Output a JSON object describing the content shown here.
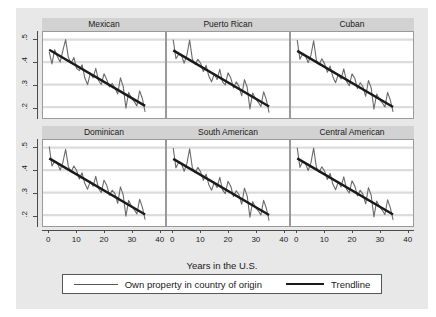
{
  "figure": {
    "xlabel": "Years in the U.S.",
    "legend": {
      "series_label": "Own property in country of origin",
      "trend_label": "Trendline",
      "series_icon": "thin-line-icon",
      "trend_icon": "thick-line-icon"
    }
  },
  "axes": {
    "ytick_labels": [
      ".5",
      ".4",
      ".3",
      ".2"
    ],
    "ytick_values": [
      0.5,
      0.4,
      0.3,
      0.2
    ],
    "xtick_labels": [
      "0",
      "10",
      "20",
      "30",
      "40"
    ],
    "xtick_values": [
      0,
      10,
      20,
      30,
      40
    ]
  },
  "chart_data": {
    "type": "line",
    "title": "",
    "subtitle": "",
    "xlabel": "Years in the U.S.",
    "ylabel": "",
    "xlim": [
      -2,
      42
    ],
    "ylim": [
      0.155,
      0.53
    ],
    "grid": true,
    "grid_axis": "y",
    "legend_position": "bottom",
    "legend_entries": [
      "Own property in country of origin",
      "Trendline"
    ],
    "layout": {
      "rows": 2,
      "cols": 3
    },
    "panels": [
      {
        "title": "Mexican",
        "row": 0,
        "col": 0,
        "x": [
          0,
          1,
          2,
          3,
          4,
          5,
          6,
          7,
          8,
          9,
          10,
          11,
          12,
          13,
          14,
          15,
          16,
          17,
          18,
          19,
          20,
          21,
          22,
          23,
          24,
          25,
          26,
          27,
          28,
          29,
          30,
          31,
          32,
          33,
          34,
          35
        ],
        "series": [
          {
            "name": "Own property in country of origin",
            "values": [
              0.445,
              0.392,
              0.455,
              0.425,
              0.4,
              0.452,
              0.5,
              0.42,
              0.395,
              0.42,
              0.372,
              0.362,
              0.388,
              0.33,
              0.3,
              0.35,
              0.33,
              0.372,
              0.318,
              0.3,
              0.348,
              0.322,
              0.29,
              0.305,
              0.285,
              0.258,
              0.33,
              0.292,
              0.195,
              0.265,
              0.24,
              0.225,
              0.205,
              0.272,
              0.238,
              0.178
            ]
          }
        ],
        "trendline": {
          "name": "Trendline",
          "x": [
            0,
            35
          ],
          "y": [
            0.455,
            0.205
          ],
          "slope": -0.00714,
          "intercept": 0.455
        }
      },
      {
        "title": "Puerto Rican",
        "row": 0,
        "col": 1,
        "x": [
          0,
          1,
          2,
          3,
          4,
          5,
          6,
          7,
          8,
          9,
          10,
          11,
          12,
          13,
          14,
          15,
          16,
          17,
          18,
          19,
          20,
          21,
          22,
          23,
          24,
          25,
          26,
          27,
          28,
          29,
          30,
          31,
          32,
          33,
          34,
          35
        ],
        "series": [
          {
            "name": "Own property in country of origin",
            "values": [
              0.5,
              0.415,
              0.435,
              0.43,
              0.395,
              0.432,
              0.498,
              0.412,
              0.39,
              0.412,
              0.395,
              0.358,
              0.385,
              0.338,
              0.312,
              0.348,
              0.322,
              0.368,
              0.312,
              0.298,
              0.352,
              0.33,
              0.285,
              0.312,
              0.292,
              0.25,
              0.322,
              0.288,
              0.192,
              0.262,
              0.238,
              0.222,
              0.202,
              0.268,
              0.232,
              0.175
            ]
          }
        ],
        "trendline": {
          "name": "Trendline",
          "x": [
            0,
            35
          ],
          "y": [
            0.452,
            0.202
          ],
          "slope": -0.00714,
          "intercept": 0.452
        }
      },
      {
        "title": "Cuban",
        "row": 0,
        "col": 2,
        "x": [
          0,
          1,
          2,
          3,
          4,
          5,
          6,
          7,
          8,
          9,
          10,
          11,
          12,
          13,
          14,
          15,
          16,
          17,
          18,
          19,
          20,
          21,
          22,
          23,
          24,
          25,
          26,
          27,
          28,
          29,
          30,
          31,
          32,
          33,
          34,
          35
        ],
        "series": [
          {
            "name": "Own property in country of origin",
            "values": [
              0.498,
              0.412,
              0.438,
              0.428,
              0.398,
              0.43,
              0.495,
              0.408,
              0.388,
              0.415,
              0.392,
              0.355,
              0.382,
              0.335,
              0.308,
              0.345,
              0.325,
              0.37,
              0.315,
              0.295,
              0.348,
              0.328,
              0.282,
              0.308,
              0.29,
              0.248,
              0.318,
              0.285,
              0.19,
              0.258,
              0.235,
              0.22,
              0.2,
              0.265,
              0.23,
              0.178
            ]
          }
        ],
        "trendline": {
          "name": "Trendline",
          "x": [
            0,
            35
          ],
          "y": [
            0.45,
            0.2
          ],
          "slope": -0.00714,
          "intercept": 0.45
        }
      },
      {
        "title": "Dominican",
        "row": 1,
        "col": 0,
        "x": [
          0,
          1,
          2,
          3,
          4,
          5,
          6,
          7,
          8,
          9,
          10,
          11,
          12,
          13,
          14,
          15,
          16,
          17,
          18,
          19,
          20,
          21,
          22,
          23,
          24,
          25,
          26,
          27,
          28,
          29,
          30,
          31,
          32,
          33,
          34,
          35
        ],
        "series": [
          {
            "name": "Own property in country of origin",
            "values": [
              0.505,
              0.418,
              0.44,
              0.432,
              0.4,
              0.435,
              0.492,
              0.415,
              0.392,
              0.418,
              0.398,
              0.36,
              0.388,
              0.34,
              0.315,
              0.35,
              0.328,
              0.372,
              0.318,
              0.3,
              0.355,
              0.332,
              0.288,
              0.31,
              0.295,
              0.252,
              0.325,
              0.29,
              0.195,
              0.265,
              0.24,
              0.225,
              0.205,
              0.27,
              0.235,
              0.18
            ]
          }
        ],
        "trendline": {
          "name": "Trendline",
          "x": [
            0,
            35
          ],
          "y": [
            0.452,
            0.202
          ],
          "slope": -0.00714,
          "intercept": 0.452
        }
      },
      {
        "title": "South American",
        "row": 1,
        "col": 1,
        "x": [
          0,
          1,
          2,
          3,
          4,
          5,
          6,
          7,
          8,
          9,
          10,
          11,
          12,
          13,
          14,
          15,
          16,
          17,
          18,
          19,
          20,
          21,
          22,
          23,
          24,
          25,
          26,
          27,
          28,
          29,
          30,
          31,
          32,
          33,
          34,
          35
        ],
        "series": [
          {
            "name": "Own property in country of origin",
            "values": [
              0.498,
              0.41,
              0.435,
              0.428,
              0.395,
              0.43,
              0.495,
              0.41,
              0.388,
              0.412,
              0.392,
              0.355,
              0.382,
              0.335,
              0.31,
              0.345,
              0.322,
              0.368,
              0.312,
              0.295,
              0.35,
              0.328,
              0.282,
              0.308,
              0.29,
              0.248,
              0.32,
              0.285,
              0.19,
              0.26,
              0.235,
              0.22,
              0.2,
              0.265,
              0.23,
              0.175
            ]
          }
        ],
        "trendline": {
          "name": "Trendline",
          "x": [
            0,
            35
          ],
          "y": [
            0.45,
            0.2
          ],
          "slope": -0.00714,
          "intercept": 0.45
        }
      },
      {
        "title": "Central American",
        "row": 1,
        "col": 2,
        "x": [
          0,
          1,
          2,
          3,
          4,
          5,
          6,
          7,
          8,
          9,
          10,
          11,
          12,
          13,
          14,
          15,
          16,
          17,
          18,
          19,
          20,
          21,
          22,
          23,
          24,
          25,
          26,
          27,
          28,
          29,
          30,
          31,
          32,
          33,
          34,
          35
        ],
        "series": [
          {
            "name": "Own property in country of origin",
            "values": [
              0.5,
              0.412,
              0.438,
              0.43,
              0.398,
              0.432,
              0.498,
              0.412,
              0.39,
              0.415,
              0.395,
              0.358,
              0.385,
              0.338,
              0.312,
              0.348,
              0.325,
              0.37,
              0.315,
              0.298,
              0.352,
              0.33,
              0.285,
              0.31,
              0.292,
              0.25,
              0.322,
              0.288,
              0.192,
              0.262,
              0.238,
              0.222,
              0.202,
              0.268,
              0.232,
              0.178
            ]
          }
        ],
        "trendline": {
          "name": "Trendline",
          "x": [
            0,
            35
          ],
          "y": [
            0.452,
            0.202
          ],
          "slope": -0.00714,
          "intercept": 0.452
        }
      }
    ]
  },
  "colors": {
    "plate_background": "#e8e8e8",
    "panel_background": "#ffffff",
    "title_band": "#d2d2d2",
    "series_line": "#6b6b6b",
    "trend_line": "#1a1a1a",
    "grid_line": "#dcdcdc",
    "axis": "#4a4a4a",
    "text": "#1a1a1a"
  }
}
